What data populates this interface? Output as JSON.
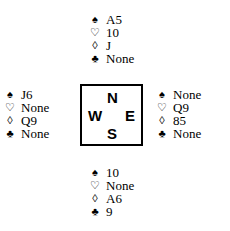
{
  "diagram": {
    "type": "bridge-deal",
    "suit_symbols": {
      "spades": "♠",
      "hearts": "♡",
      "diamonds": "◊",
      "clubs": "♣"
    },
    "compass": {
      "north": "N",
      "south": "S",
      "east": "E",
      "west": "W"
    },
    "hands": {
      "north": {
        "spades": "A5",
        "hearts": "10",
        "diamonds": "J",
        "clubs": "None"
      },
      "west": {
        "spades": "J6",
        "hearts": "None",
        "diamonds": "Q9",
        "clubs": "None"
      },
      "east": {
        "spades": "None",
        "hearts": "Q9",
        "diamonds": "85",
        "clubs": "None"
      },
      "south": {
        "spades": "10",
        "hearts": "None",
        "diamonds": "A6",
        "clubs": "9"
      }
    }
  }
}
